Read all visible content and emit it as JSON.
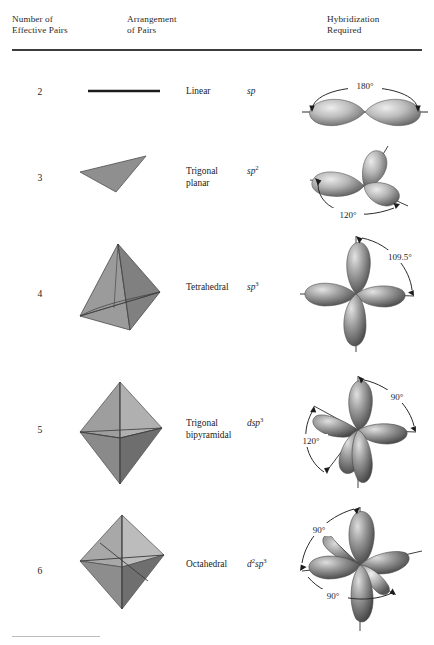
{
  "header": {
    "columns": [
      {
        "name": "number-effective-pairs",
        "line1": "Number of",
        "line2": "Effective Pairs"
      },
      {
        "name": "arrangement-of-pairs",
        "line1": "Arrangement",
        "line2": "of Pairs"
      },
      {
        "name": "hybridization-required",
        "line1": "Hybridization",
        "line2": "Required"
      }
    ]
  },
  "rows": [
    {
      "pairs": "2",
      "geometry_icon": "linear-shape",
      "arrangement_line1": "Linear",
      "arrangement_line2": "",
      "hybrid_base": "sp",
      "hybrid_sup": "",
      "hybrid_prefix": "",
      "hybrid_prefix_sup": "",
      "orbital_icon": "sp-orbital-diagram",
      "angles": [
        "180°"
      ]
    },
    {
      "pairs": "3",
      "geometry_icon": "trigonal-planar-shape",
      "arrangement_line1": "Trigonal",
      "arrangement_line2": "planar",
      "hybrid_base": "sp",
      "hybrid_sup": "2",
      "hybrid_prefix": "",
      "hybrid_prefix_sup": "",
      "orbital_icon": "sp2-orbital-diagram",
      "angles": [
        "120°"
      ]
    },
    {
      "pairs": "4",
      "geometry_icon": "tetrahedron-shape",
      "arrangement_line1": "Tetrahedral",
      "arrangement_line2": "",
      "hybrid_base": "sp",
      "hybrid_sup": "3",
      "hybrid_prefix": "",
      "hybrid_prefix_sup": "",
      "orbital_icon": "sp3-orbital-diagram",
      "angles": [
        "109.5°"
      ]
    },
    {
      "pairs": "5",
      "geometry_icon": "trigonal-bipyramid-shape",
      "arrangement_line1": "Trigonal",
      "arrangement_line2": "bipyramidal",
      "hybrid_base": "sp",
      "hybrid_sup": "3",
      "hybrid_prefix": "d",
      "hybrid_prefix_sup": "",
      "orbital_icon": "dsp3-orbital-diagram",
      "angles": [
        "90°",
        "120°"
      ]
    },
    {
      "pairs": "6",
      "geometry_icon": "octahedron-shape",
      "arrangement_line1": "Octahedral",
      "arrangement_line2": "",
      "hybrid_base": "sp",
      "hybrid_sup": "3",
      "hybrid_prefix": "d",
      "hybrid_prefix_sup": "2",
      "orbital_icon": "d2sp3-orbital-diagram",
      "angles": [
        "90°",
        "90°"
      ]
    }
  ],
  "colors": {
    "rule": "#3d3d3d",
    "text": "#1c1c1c",
    "solid_light": "#b4b4b4",
    "solid_mid": "#8f8f8f",
    "solid_dark": "#6e6e6e",
    "lobe_light": "#e6e6e6",
    "lobe_dark": "#4a4a4a",
    "background": "#ffffff"
  },
  "angle_labels": {
    "sp": "180°",
    "sp2": "120°",
    "sp3": "109.5°",
    "dsp3_axial": "90°",
    "dsp3_equatorial": "120°",
    "d2sp3_upper": "90°",
    "d2sp3_lower": "90°"
  }
}
